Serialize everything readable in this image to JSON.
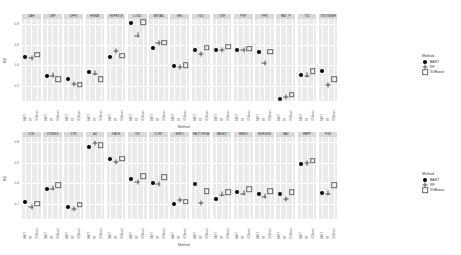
{
  "chart_data": {
    "type": "scatter",
    "title": "",
    "layout": "faceted (2 rows of small-multiple panels)",
    "xlabel": "Method",
    "ylabel": "R2",
    "categories": [
      "BART",
      "RF",
      "XGBoost"
    ],
    "legend": {
      "title": "Method",
      "position": "right",
      "entries": [
        {
          "label": "BART",
          "shape": "filled-circle"
        },
        {
          "label": "RF",
          "shape": "plus"
        },
        {
          "label": "XGBoost",
          "shape": "open-square"
        }
      ]
    },
    "grid": true,
    "rows": [
      {
        "yticks": [
          "0.2",
          "0.4",
          "0.6",
          "0.8"
        ],
        "ylim": [
          0.05,
          0.85
        ],
        "panels": [
          {
            "name": "DAH",
            "values": [
              0.48,
              0.47,
              0.5
            ]
          },
          {
            "name": "DBP",
            "values": [
              0.29,
              0.3,
              0.26
            ]
          },
          {
            "name": "DPF4",
            "values": [
              0.26,
              0.22,
              0.21
            ]
          },
          {
            "name": "HKRAT",
            "values": [
              0.33,
              0.32,
              0.26
            ]
          },
          {
            "name": "HVPRICE",
            "values": [
              0.48,
              0.54,
              0.49
            ]
          },
          {
            "name": "LOGD",
            "values": [
              0.81,
              0.69,
              0.82
            ]
          },
          {
            "name": "METAB",
            "values": [
              0.57,
              0.62,
              0.62
            ]
          },
          {
            "name": "NH1",
            "values": [
              0.39,
              0.38,
              0.4
            ]
          },
          {
            "name": "OD1",
            "values": [
              0.55,
              0.51,
              0.57
            ]
          },
          {
            "name": "OXE",
            "values": [
              0.55,
              0.55,
              0.58
            ]
          },
          {
            "name": "PSP",
            "values": [
              0.55,
              0.55,
              0.56
            ]
          },
          {
            "name": "PPB",
            "values": [
              0.53,
              0.42,
              0.53
            ]
          },
          {
            "name": "RAT_P",
            "values": [
              0.07,
              0.09,
              0.11
            ]
          },
          {
            "name": "TS2",
            "values": [
              0.3,
              0.3,
              0.34
            ]
          },
          {
            "name": "TWOSMBH",
            "values": [
              0.34,
              0.21,
              0.26
            ]
          }
        ]
      },
      {
        "yticks": [
          "0.2",
          "0.4",
          "0.6",
          "0.8"
        ],
        "ylim": [
          0.05,
          0.85
        ],
        "panels": [
          {
            "name": "ZCB",
            "values": [
              0.22,
              0.17,
              0.2
            ]
          },
          {
            "name": "ZONING",
            "values": [
              0.34,
              0.35,
              0.38
            ]
          },
          {
            "name": "ZOK",
            "values": [
              0.17,
              0.15,
              0.19
            ]
          },
          {
            "name": "AX",
            "values": [
              0.75,
              0.79,
              0.77
            ]
          },
          {
            "name": "KADE",
            "values": [
              0.64,
              0.61,
              0.64
            ]
          },
          {
            "name": "OXI",
            "values": [
              0.44,
              0.41,
              0.47
            ]
          },
          {
            "name": "CLINT",
            "values": [
              0.4,
              0.39,
              0.46
            ]
          },
          {
            "name": "ERKO",
            "values": [
              0.2,
              0.24,
              0.22
            ]
          },
          {
            "name": "FACTORXA",
            "values": [
              0.39,
              0.21,
              0.32
            ]
          },
          {
            "name": "FASBIT",
            "values": [
              0.25,
              0.29,
              0.31
            ]
          },
          {
            "name": "HERG",
            "values": [
              0.31,
              0.3,
              0.34
            ]
          },
          {
            "name": "HDRGSN",
            "values": [
              0.29,
              0.27,
              0.32
            ]
          },
          {
            "name": "NAV",
            "values": [
              0.29,
              0.25,
              0.31
            ]
          },
          {
            "name": "PAPP",
            "values": [
              0.59,
              0.6,
              0.62
            ]
          },
          {
            "name": "PGK",
            "values": [
              0.3,
              0.3,
              0.38
            ]
          }
        ]
      }
    ]
  },
  "axis": {
    "x_title": "Method",
    "y_title": "R2"
  },
  "legend": {
    "title": "Method",
    "items": [
      "BART",
      "RF",
      "XGBoost"
    ]
  }
}
